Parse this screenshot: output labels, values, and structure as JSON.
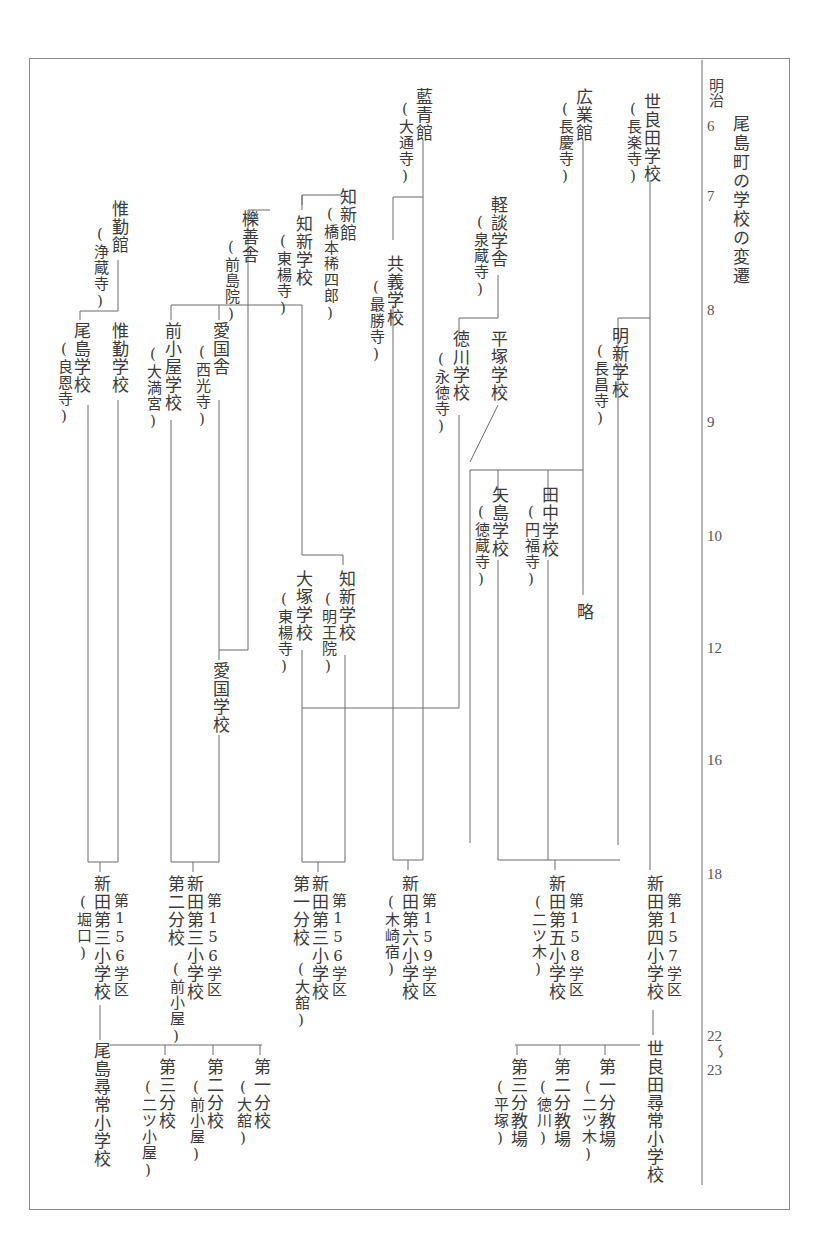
{
  "title": "尾島町の学校の変遷",
  "timeline": {
    "era": "明治",
    "years": [
      {
        "label": "6",
        "y": 128
      },
      {
        "label": "7",
        "y": 198
      },
      {
        "label": "8",
        "y": 312
      },
      {
        "label": "9",
        "y": 424
      },
      {
        "label": "10",
        "y": 538
      },
      {
        "label": "12",
        "y": 650
      },
      {
        "label": "16",
        "y": 762
      },
      {
        "label": "18",
        "y": 876
      },
      {
        "label": "22",
        "y": 1038
      },
      {
        "label": "〜",
        "y": 1060
      },
      {
        "label": "23",
        "y": 1080
      }
    ]
  },
  "schools": {
    "serada": {
      "name": "世良田学校",
      "note": "(長楽寺)"
    },
    "kogyokan": {
      "name": "広業館",
      "note": "(長慶寺)"
    },
    "aioseikan": {
      "name": "藍青館",
      "note": "(大通寺)"
    },
    "keidan": {
      "name": "軽談学舎",
      "note": "(泉蔵寺)"
    },
    "chishinkan": {
      "name": "知新館",
      "note": "(橋本稀四郎)"
    },
    "chishin1": {
      "name": "知新学校",
      "note": "(東楊寺)"
    },
    "rekizensha": {
      "name": "櫟善舎",
      "note": "(前島院)"
    },
    "ishinkan": {
      "name": "惟勤館",
      "note": "(浄蔵寺)"
    },
    "kyogi": {
      "name": "共義学校",
      "note": "(最勝寺)"
    },
    "meishin": {
      "name": "明新学校",
      "note": "(長昌寺)"
    },
    "tokugawa": {
      "name": "徳川学校",
      "note": "(永徳寺)"
    },
    "hiratsuka": {
      "name": "平塚学校",
      "note": ""
    },
    "ojima": {
      "name": "尾島学校",
      "note": "(良恩寺)"
    },
    "ishin": {
      "name": "惟勤学校",
      "note": ""
    },
    "maegoya": {
      "name": "前小屋学校",
      "note": "(大満宮)"
    },
    "aikokusha": {
      "name": "愛国舎",
      "note": "(西光寺)"
    },
    "yajima": {
      "name": "矢島学校",
      "note": "(徳蔵寺)"
    },
    "tanaka": {
      "name": "田中学校",
      "note": "(円福寺)"
    },
    "ryaku": {
      "name": "略",
      "note": ""
    },
    "otsuka": {
      "name": "大塚学校",
      "note": "(東楊寺)"
    },
    "chishin2": {
      "name": "知新学校",
      "note": "(明王院)"
    },
    "aikoku": {
      "name": "愛国学校",
      "note": ""
    }
  },
  "nitta_schools": [
    {
      "id": "d156_3",
      "district": "第156学区",
      "name": "新田第三小学校",
      "note": "(堀口)",
      "branch": ""
    },
    {
      "id": "d156_3b2",
      "district": "第156学区",
      "name": "新田第三小学校",
      "note": "(前小屋)",
      "branch": "第二分校"
    },
    {
      "id": "d156_3b1",
      "district": "第156学区",
      "name": "新田第三小学校",
      "note": "(大舘)",
      "branch": "第一分校"
    },
    {
      "id": "d159_6",
      "district": "第159学区",
      "name": "新田第六小学校",
      "note": "(木崎宿)",
      "branch": ""
    },
    {
      "id": "d158_5",
      "district": "第158学区",
      "name": "新田第五小学校",
      "note": "(二ツ木)",
      "branch": ""
    },
    {
      "id": "d157_4",
      "district": "第157学区",
      "name": "新田第四小学校",
      "note": "",
      "branch": ""
    }
  ],
  "final": {
    "ojima_jinjo": {
      "name": "尾島尋常小学校"
    },
    "ojima_branches": [
      {
        "name": "第三分校",
        "note": "(二ツ小屋)"
      },
      {
        "name": "第二分校",
        "note": "(前小屋)"
      },
      {
        "name": "第一分校",
        "note": "(大舘)"
      }
    ],
    "serada_jinjo": {
      "name": "世良田尋常小学校"
    },
    "serada_branches": [
      {
        "name": "第三分教場",
        "note": "(平塚)"
      },
      {
        "name": "第二分教場",
        "note": "(徳川)"
      },
      {
        "name": "第一分教場",
        "note": "(二ツ木)"
      }
    ]
  },
  "colors": {
    "line": "#6a6a6a",
    "text": "#3a3a3a",
    "frame": "#8a8a8a"
  }
}
